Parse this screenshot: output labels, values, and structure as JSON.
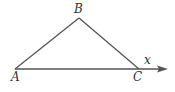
{
  "diagram": {
    "type": "triangle-with-ray",
    "vertices": [
      {
        "id": "A",
        "label": "A",
        "x": 15,
        "y": 69,
        "label_x": 11,
        "label_y": 81
      },
      {
        "id": "B",
        "label": "B",
        "x": 79,
        "y": 18,
        "label_x": 74,
        "label_y": 13
      },
      {
        "id": "C",
        "label": "C",
        "x": 139,
        "y": 69,
        "label_x": 133,
        "label_y": 81
      }
    ],
    "edges": [
      {
        "from": "A",
        "to": "B"
      },
      {
        "from": "B",
        "to": "C"
      },
      {
        "from": "A",
        "to": "C"
      }
    ],
    "ray": {
      "from": "C",
      "end_x": 167,
      "end_y": 69,
      "label": "x",
      "label_x": 144,
      "label_y": 64
    },
    "colors": {
      "line": "#555555",
      "text": "#333333",
      "background": "#ffffff"
    }
  }
}
